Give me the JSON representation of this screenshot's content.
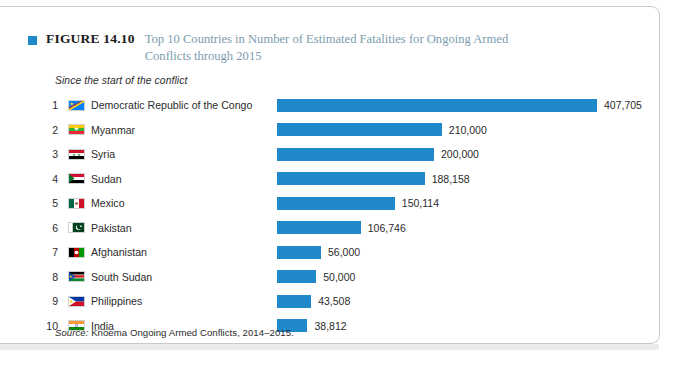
{
  "figure": {
    "label": "FIGURE 14.10",
    "title": "Top 10 Countries in Number of Estimated Fatalities for Ongoing Armed Conflicts through 2015",
    "sub_caption": "Since the start of the conflict",
    "source": "Source: Knoema Ongoing Armed Conflicts, 2014–2015.",
    "source_lead": "Source:",
    "source_rest": " Knoema Ongoing Armed Conflicts, 2014–2015.",
    "marker_icon": "blue-square-icon"
  },
  "colors": {
    "bar": "#2089c9",
    "title_text": "#7c9cae",
    "label_text": "#1b1b1b",
    "frame_border": "#c9c9c9",
    "page_band": "#ececec"
  },
  "chart_data": {
    "type": "bar",
    "orientation": "horizontal",
    "title": "Top 10 Countries in Number of Estimated Fatalities for Ongoing Armed Conflicts through 2015",
    "subtitle": "Since the start of the conflict",
    "xlabel": "",
    "ylabel": "",
    "grid": false,
    "legend": "none",
    "xlim": [
      0,
      407705
    ],
    "categories": [
      "Democratic Republic of the Congo",
      "Myanmar",
      "Syria",
      "Sudan",
      "Mexico",
      "Pakistan",
      "Afghanistan",
      "South Sudan",
      "Philippines",
      "India"
    ],
    "values": [
      407705,
      210000,
      200000,
      188158,
      150114,
      106746,
      56000,
      50000,
      43508,
      38812
    ],
    "value_labels": [
      "407,705",
      "210,000",
      "200,000",
      "188,158",
      "150,114",
      "106,746",
      "56,000",
      "50,000",
      "43,508",
      "38,812"
    ],
    "rows": [
      {
        "rank": "1",
        "country": "Democratic Republic of the Congo",
        "value": 407705,
        "label": "407,705",
        "flag": "flag-cd"
      },
      {
        "rank": "2",
        "country": "Myanmar",
        "value": 210000,
        "label": "210,000",
        "flag": "flag-mm"
      },
      {
        "rank": "3",
        "country": "Syria",
        "value": 200000,
        "label": "200,000",
        "flag": "flag-sy"
      },
      {
        "rank": "4",
        "country": "Sudan",
        "value": 188158,
        "label": "188,158",
        "flag": "flag-sd"
      },
      {
        "rank": "5",
        "country": "Mexico",
        "value": 150114,
        "label": "150,114",
        "flag": "flag-mx"
      },
      {
        "rank": "6",
        "country": "Pakistan",
        "value": 106746,
        "label": "106,746",
        "flag": "flag-pk"
      },
      {
        "rank": "7",
        "country": "Afghanistan",
        "value": 56000,
        "label": "56,000",
        "flag": "flag-af"
      },
      {
        "rank": "8",
        "country": "South Sudan",
        "value": 50000,
        "label": "50,000",
        "flag": "flag-ss"
      },
      {
        "rank": "9",
        "country": "Philippines",
        "value": 43508,
        "label": "43,508",
        "flag": "flag-ph"
      },
      {
        "rank": "10",
        "country": "India",
        "value": 38812,
        "label": "38,812",
        "flag": "flag-in"
      }
    ]
  }
}
